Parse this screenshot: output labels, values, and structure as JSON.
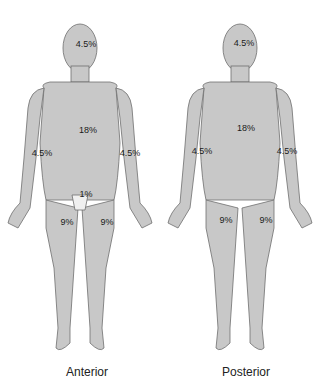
{
  "figures": [
    {
      "caption": "Anterior",
      "labels": {
        "head": "4.5%",
        "trunk": "18%",
        "arm_left": "4.5%",
        "arm_right": "4.5%",
        "genitalia": "1%",
        "leg_left": "9%",
        "leg_right": "9%"
      }
    },
    {
      "caption": "Posterior",
      "labels": {
        "head": "4.5%",
        "trunk": "18%",
        "arm_left": "4.5%",
        "arm_right": "4.5%",
        "leg_left": "9%",
        "leg_right": "9%"
      }
    }
  ],
  "colors": {
    "body_fill": "#c8c8c8",
    "outline": "#6e6e6e",
    "genital_fill": "#f0f0f0"
  }
}
